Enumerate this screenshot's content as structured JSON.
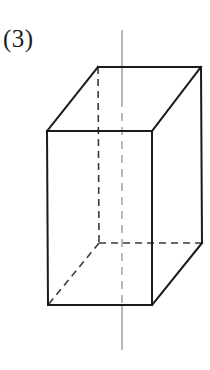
{
  "figure": {
    "label": "(3)",
    "caption_text": "(3)",
    "shape_name": "rectangular-prism",
    "background_color": "#ffffff",
    "solid_edge_color": "#1b1b1b",
    "hidden_edge_color": "#3a3a3a",
    "axis_color": "#9a9a9a",
    "label_color": "#1b1b1b",
    "solid_edge_width": 2,
    "hidden_edge_width": 1.6,
    "axis_width": 1.4,
    "hidden_dash_pattern": "7,5",
    "axis_dash_pattern": "8,6"
  },
  "geometry": {
    "front_face": {
      "name": "front-face",
      "top_left": {
        "x": 47,
        "y": 131
      },
      "top_right": {
        "x": 152,
        "y": 131
      },
      "bottom_right": {
        "x": 152,
        "y": 305
      },
      "bottom_left": {
        "x": 48,
        "y": 305
      },
      "points": "47,131 152,131 152,305 48,305"
    },
    "back_face": {
      "name": "back-face",
      "top_left": {
        "x": 98,
        "y": 67
      },
      "top_right": {
        "x": 201,
        "y": 67
      },
      "bottom_right": {
        "x": 202,
        "y": 243
      },
      "bottom_left": {
        "x": 99,
        "y": 243
      },
      "points": "98,67 201,67 202,243 99,243"
    },
    "top_face": {
      "name": "top-face",
      "points": "47,131 98,67 201,67 152,131"
    },
    "right_face": {
      "name": "right-face",
      "points": "152,131 201,67 202,243 152,305"
    },
    "solid_edges": [
      {
        "name": "front-top-edge",
        "x1": 47,
        "y1": 131,
        "x2": 152,
        "y2": 131
      },
      {
        "name": "front-right-edge",
        "x1": 152,
        "y1": 131,
        "x2": 152,
        "y2": 305
      },
      {
        "name": "front-bottom-edge",
        "x1": 152,
        "y1": 305,
        "x2": 48,
        "y2": 305
      },
      {
        "name": "front-left-edge",
        "x1": 48,
        "y1": 305,
        "x2": 47,
        "y2": 131
      },
      {
        "name": "top-left-slant-edge",
        "x1": 47,
        "y1": 131,
        "x2": 98,
        "y2": 67
      },
      {
        "name": "back-top-edge",
        "x1": 98,
        "y1": 67,
        "x2": 201,
        "y2": 67
      },
      {
        "name": "top-right-slant-edge",
        "x1": 201,
        "y1": 67,
        "x2": 152,
        "y2": 131
      },
      {
        "name": "back-right-vertical-edge",
        "x1": 201,
        "y1": 67,
        "x2": 202,
        "y2": 243
      },
      {
        "name": "bottom-right-slant-edge",
        "x1": 202,
        "y1": 243,
        "x2": 152,
        "y2": 305
      }
    ],
    "hidden_edges": [
      {
        "name": "back-left-vertical-edge",
        "x1": 98,
        "y1": 67,
        "x2": 99,
        "y2": 243
      },
      {
        "name": "back-bottom-edge",
        "x1": 99,
        "y1": 243,
        "x2": 202,
        "y2": 243
      },
      {
        "name": "bottom-left-slant-edge",
        "x1": 99,
        "y1": 243,
        "x2": 48,
        "y2": 305
      }
    ],
    "axis": {
      "name": "axis-of-symmetry",
      "x": 122,
      "top_y": 30,
      "bottom_y": 350,
      "solid_segments": [
        {
          "name": "axis-upper-solid",
          "x1": 122,
          "y1": 30,
          "x2": 122,
          "y2": 99
        },
        {
          "name": "axis-lower-solid",
          "x1": 122,
          "y1": 305,
          "x2": 122,
          "y2": 350
        }
      ],
      "dashed_segments": [
        {
          "name": "axis-inner-dashed",
          "x1": 122,
          "y1": 99,
          "x2": 122,
          "y2": 305
        }
      ]
    }
  }
}
